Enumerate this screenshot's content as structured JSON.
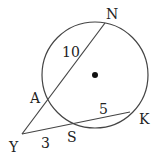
{
  "diagram": {
    "type": "circle-secant-secant",
    "circle": {
      "cx": 95,
      "cy": 75,
      "r": 53
    },
    "points": {
      "N": {
        "label": "N",
        "x": 105,
        "y": 23,
        "lx": 106,
        "ly": 19
      },
      "A": {
        "label": "A",
        "x": 48,
        "y": 100,
        "lx": 30,
        "ly": 103
      },
      "Y": {
        "label": "Y",
        "x": 22,
        "y": 134,
        "lx": 9,
        "ly": 152
      },
      "S": {
        "label": "S",
        "x": 74,
        "y": 124,
        "lx": 67,
        "ly": 142
      },
      "K": {
        "label": "K",
        "x": 130,
        "y": 112,
        "lx": 139,
        "ly": 124
      }
    },
    "segments": [
      {
        "from": "Y",
        "to": "N"
      },
      {
        "from": "Y",
        "to": "K"
      }
    ],
    "lengths": [
      {
        "segment": "AN",
        "value": "10",
        "x": 62,
        "y": 57
      },
      {
        "segment": "SK",
        "value": "5",
        "x": 99,
        "y": 114
      },
      {
        "segment": "YS",
        "value": "3",
        "x": 41,
        "y": 148
      }
    ],
    "center_dot": {
      "x": 95,
      "y": 75
    }
  }
}
